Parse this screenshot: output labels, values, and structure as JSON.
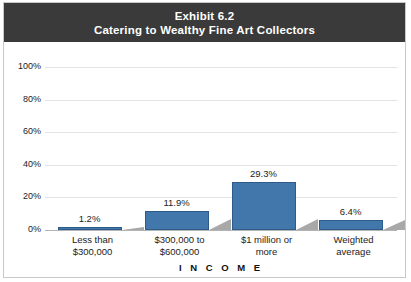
{
  "title": {
    "line1": "Exhibit 6.2",
    "line2": "Catering to Wealthy Fine Art Collectors"
  },
  "colors": {
    "bar_fill": "#4277ab",
    "bar_border": "#2e5c8a",
    "shadow": "#a8a8a8",
    "title_bar_bg": "#3a3a3a",
    "title_text": "#ffffff",
    "gridline": "#e3e3e3",
    "axis_line": "#b4b4b4",
    "frame": "#c9c9c9",
    "text": "#1c1c1c"
  },
  "chart_data": {
    "type": "bar",
    "xlabel": "I N C O M E",
    "ylabel": "",
    "ylim": [
      0,
      100
    ],
    "yticks": [
      0,
      20,
      40,
      60,
      80,
      100
    ],
    "ytick_labels": [
      "0%",
      "20%",
      "40%",
      "60%",
      "80%",
      "100%"
    ],
    "grid": true,
    "legend": false,
    "categories": [
      "Less than\n$300,000",
      "$300,000 to\n$600,000",
      "$1 million or\nmore",
      "Weighted\naverage"
    ],
    "category_lines": [
      [
        "Less than",
        "$300,000"
      ],
      [
        "$300,000 to",
        "$600,000"
      ],
      [
        "$1 million or",
        "more"
      ],
      [
        "Weighted",
        "average"
      ]
    ],
    "values": [
      1.2,
      11.9,
      29.3,
      6.4
    ],
    "data_labels": [
      "1.2%",
      "11.9%",
      "29.3%",
      "6.4%"
    ]
  }
}
